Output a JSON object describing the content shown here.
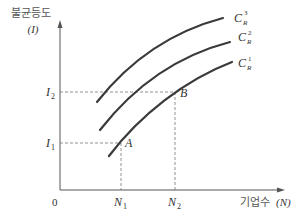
{
  "diagram": {
    "y_axis_label": "불균등도",
    "y_axis_symbol": "(I)",
    "x_axis_label": "기업수",
    "x_axis_symbol": "(N)",
    "origin": "0",
    "y_ticks": [
      {
        "base": "I",
        "sub": "2"
      },
      {
        "base": "I",
        "sub": "1"
      }
    ],
    "x_ticks": [
      {
        "base": "N",
        "sub": "1"
      },
      {
        "base": "N",
        "sub": "2"
      }
    ],
    "points": [
      {
        "label": "A"
      },
      {
        "label": "B"
      }
    ],
    "curves": [
      {
        "base": "C",
        "sub": "R",
        "sup": "3"
      },
      {
        "base": "C",
        "sub": "R",
        "sup": "2"
      },
      {
        "base": "C",
        "sub": "R",
        "sup": "1"
      }
    ],
    "colors": {
      "curve": "#3a3a3a",
      "axis": "#555555",
      "guide": "#777777"
    }
  }
}
